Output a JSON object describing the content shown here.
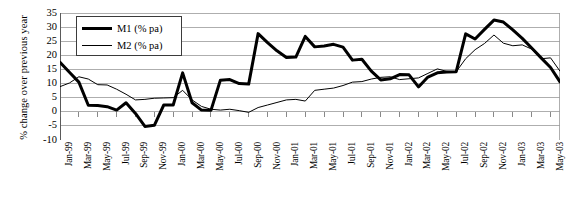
{
  "chart_data": {
    "type": "line",
    "title": "",
    "xlabel": "",
    "ylabel": "% change over previous year",
    "ylim": [
      -10,
      35
    ],
    "ytick_step": 5,
    "yticks": [
      35,
      30,
      25,
      20,
      15,
      10,
      5,
      0,
      -5,
      -10
    ],
    "grid": true,
    "legend_position": "top-left",
    "x": [
      "Jan-99",
      "Feb-99",
      "Mar-99",
      "Apr-99",
      "May-99",
      "Jun-99",
      "Jul-99",
      "Aug-99",
      "Sep-99",
      "Oct-99",
      "Nov-99",
      "Dec-99",
      "Jan-00",
      "Feb-00",
      "Mar-00",
      "Apr-00",
      "May-00",
      "Jun-00",
      "Jul-00",
      "Aug-00",
      "Sep-00",
      "Oct-00",
      "Nov-00",
      "Dec-00",
      "Jan-01",
      "Feb-01",
      "Mar-01",
      "Apr-01",
      "May-01",
      "Jun-01",
      "Jul-01",
      "Aug-01",
      "Sep-01",
      "Oct-01",
      "Nov-01",
      "Dec-01",
      "Jan-02",
      "Feb-02",
      "Mar-02",
      "Apr-02",
      "May-02",
      "Jun-02",
      "Jul-02",
      "Aug-02",
      "Sep-02",
      "Oct-02",
      "Nov-02",
      "Dec-02",
      "Jan-03",
      "Feb-03",
      "Mar-03",
      "Apr-03",
      "May-03",
      "Jun-03"
    ],
    "xtick_labels": [
      "Jan-99",
      "Mar-99",
      "May-99",
      "Jul-99",
      "Sep-99",
      "Nov-99",
      "Jan-00",
      "Mar-00",
      "May-00",
      "Jul-00",
      "Sep-00",
      "Nov-00",
      "Jan-01",
      "Mar-01",
      "May-01",
      "Jul-01",
      "Sep-01",
      "Nov-01",
      "Jan-02",
      "Mar-02",
      "May-02",
      "Jul-02",
      "Sep-02",
      "Nov-02",
      "Jan-03",
      "Mar-03",
      "May-03"
    ],
    "xtick_every": 2,
    "series": [
      {
        "name": "M1 (% pa)",
        "style": "thick",
        "color": "#000000",
        "width": 3.0,
        "values": [
          17.5,
          14.0,
          10.5,
          2.3,
          2.2,
          1.8,
          0.6,
          3.2,
          -0.6,
          -5.2,
          -4.8,
          2.4,
          2.4,
          13.8,
          3.2,
          0.6,
          0.5,
          11.2,
          11.4,
          10.0,
          9.8,
          27.7,
          24.5,
          21.6,
          19.2,
          19.4,
          26.7,
          23.0,
          23.3,
          23.9,
          22.9,
          18.3,
          18.6,
          14.4,
          11.3,
          11.7,
          13.2,
          13.1,
          8.8,
          12.3,
          13.8,
          14.1,
          14.2,
          27.6,
          25.8,
          29.2,
          32.5,
          31.8,
          29.0,
          26.0,
          22.6,
          19.1,
          15.7,
          10.6
        ]
      },
      {
        "name": "M2 (% pa)",
        "style": "thin",
        "color": "#000000",
        "width": 1.0,
        "values": [
          8.9,
          10.2,
          12.4,
          11.6,
          9.6,
          9.5,
          8.0,
          6.2,
          4.2,
          4.4,
          4.8,
          4.9,
          5.0,
          7.6,
          4.2,
          1.9,
          0.9,
          0.6,
          0.9,
          0.4,
          -0.2,
          1.5,
          2.4,
          3.3,
          4.2,
          4.4,
          3.8,
          7.6,
          8.0,
          8.4,
          9.3,
          10.5,
          10.7,
          11.6,
          12.2,
          12.4,
          11.4,
          11.7,
          12.0,
          13.6,
          15.2,
          14.3,
          14.2,
          18.8,
          22.0,
          24.2,
          27.2,
          24.3,
          23.4,
          23.7,
          22.2,
          18.8,
          19.1,
          14.4
        ]
      }
    ]
  }
}
